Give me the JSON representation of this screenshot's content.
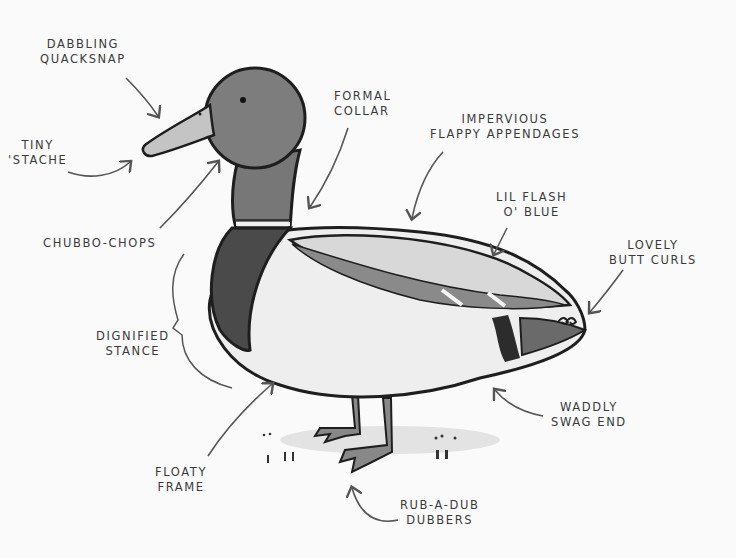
{
  "diagram": {
    "colors": {
      "background": "#fafafa",
      "outline": "#1e1e1e",
      "head": "#7d7d7d",
      "bill": "#c4c4c4",
      "chest": "#4a4a4a",
      "body": "#eeeeee",
      "wing": "#d8d8d8",
      "wing_stripe": "#8a8a8a",
      "label_text": "#3a3a3a",
      "arrow": "#555555"
    },
    "labels": [
      {
        "id": "bill",
        "line1": "Dabbling",
        "line2": "Quacksnap"
      },
      {
        "id": "mustache",
        "line1": "Tiny",
        "line2": "'Stache"
      },
      {
        "id": "cheeks",
        "line1": "Chubbo-Chops",
        "line2": ""
      },
      {
        "id": "collar",
        "line1": "Formal",
        "line2": "Collar"
      },
      {
        "id": "wings",
        "line1": "Impervious",
        "line2": "Flappy Appendages"
      },
      {
        "id": "speculum",
        "line1": "Lil Flash",
        "line2": "O' Blue"
      },
      {
        "id": "tail-curls",
        "line1": "Lovely",
        "line2": "Butt Curls"
      },
      {
        "id": "stance",
        "line1": "Dignified",
        "line2": "Stance"
      },
      {
        "id": "belly",
        "line1": "Floaty",
        "line2": "Frame"
      },
      {
        "id": "rear",
        "line1": "Waddly",
        "line2": "Swag End"
      },
      {
        "id": "feet",
        "line1": "Rub-A-Dub",
        "line2": "Dubbers"
      }
    ]
  }
}
